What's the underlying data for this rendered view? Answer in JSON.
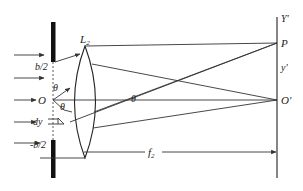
{
  "diagram": {
    "colors": {
      "stroke": "#333333",
      "slit": "#111111",
      "background": "#ffffff"
    },
    "labels": {
      "lens": "L",
      "lens_sub": "2",
      "slit_top": "b/2",
      "slit_bottom": "-b/2",
      "origin": "O",
      "theta_upper": "θ",
      "theta_lower": "θ",
      "theta_lens": "θ",
      "dy": "dy",
      "screen_axis": "Y'",
      "point_p": "P",
      "y_prime": "y'",
      "origin_image": "O'",
      "focal": "f",
      "focal_sub": "2"
    },
    "incident_arrow_count": 5
  }
}
